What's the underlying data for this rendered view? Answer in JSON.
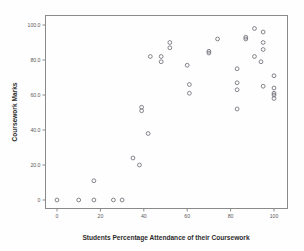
{
  "chart_data": {
    "type": "scatter",
    "title": "",
    "xlabel": "Students Percentage Attendance of their Coursework",
    "ylabel": "Coursework Marks",
    "xlim": [
      -6,
      106
    ],
    "ylim": [
      -6,
      106
    ],
    "xticks": [
      0,
      20,
      40,
      60,
      80,
      100
    ],
    "xtick_labels": [
      "0",
      "20",
      "40",
      "60",
      "80",
      "100"
    ],
    "yticks": [
      0,
      20,
      40,
      60,
      80,
      100
    ],
    "ytick_labels": [
      "0",
      "20.0",
      "40.0",
      "60.0",
      "80.0",
      "100.0"
    ],
    "grid": false,
    "legend": null,
    "marker": "open-circle",
    "marker_color": "#6f6f78",
    "points": [
      {
        "x": 0,
        "y": 0
      },
      {
        "x": 10,
        "y": 0
      },
      {
        "x": 17,
        "y": 0
      },
      {
        "x": 26,
        "y": 0
      },
      {
        "x": 30,
        "y": 0
      },
      {
        "x": 17,
        "y": 11
      },
      {
        "x": 35,
        "y": 24
      },
      {
        "x": 38,
        "y": 20
      },
      {
        "x": 42,
        "y": 38
      },
      {
        "x": 39,
        "y": 53
      },
      {
        "x": 39,
        "y": 51
      },
      {
        "x": 43,
        "y": 82
      },
      {
        "x": 48,
        "y": 82
      },
      {
        "x": 48,
        "y": 79
      },
      {
        "x": 52,
        "y": 90
      },
      {
        "x": 52,
        "y": 87
      },
      {
        "x": 61,
        "y": 66
      },
      {
        "x": 61,
        "y": 61
      },
      {
        "x": 60,
        "y": 77
      },
      {
        "x": 70,
        "y": 85
      },
      {
        "x": 70,
        "y": 84
      },
      {
        "x": 74,
        "y": 92
      },
      {
        "x": 83,
        "y": 75
      },
      {
        "x": 83,
        "y": 67
      },
      {
        "x": 83,
        "y": 63
      },
      {
        "x": 83,
        "y": 52
      },
      {
        "x": 87,
        "y": 93
      },
      {
        "x": 87,
        "y": 92
      },
      {
        "x": 91,
        "y": 98
      },
      {
        "x": 91,
        "y": 82
      },
      {
        "x": 95,
        "y": 96
      },
      {
        "x": 95,
        "y": 90
      },
      {
        "x": 95,
        "y": 86
      },
      {
        "x": 94,
        "y": 79
      },
      {
        "x": 95,
        "y": 65
      },
      {
        "x": 100,
        "y": 71
      },
      {
        "x": 100,
        "y": 64
      },
      {
        "x": 100,
        "y": 61
      },
      {
        "x": 100,
        "y": 60
      },
      {
        "x": 100,
        "y": 58
      }
    ]
  },
  "figure": {
    "background_color": "#fefefe",
    "frame_color": "#8a8a8a"
  }
}
